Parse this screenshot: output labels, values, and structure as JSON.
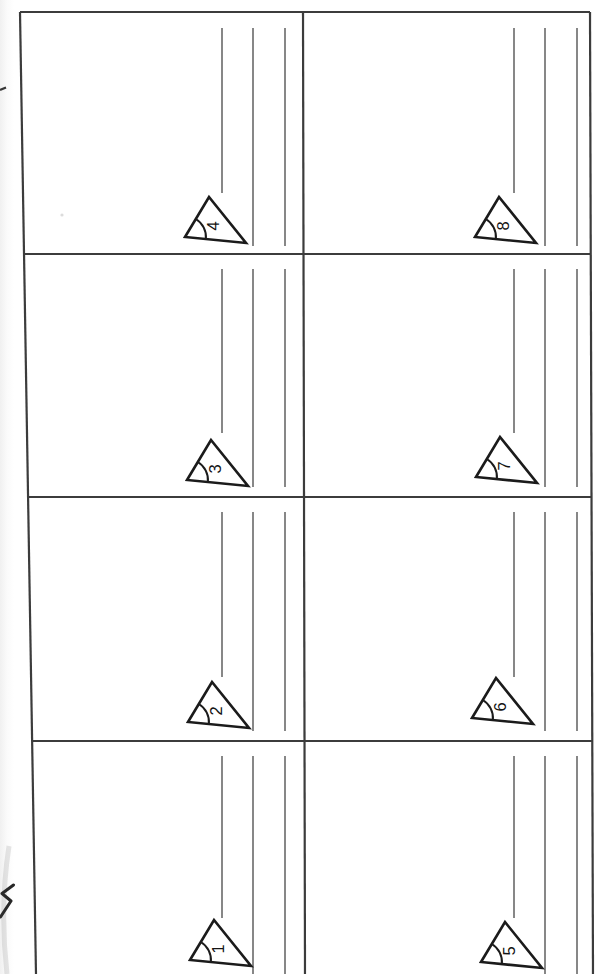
{
  "page": {
    "width": 598,
    "height": 974,
    "background": "#ffffff",
    "kind": "scanned worksheet page, rotated 90 degrees"
  },
  "colors": {
    "grid_line": "#3c3c3c",
    "answer_line": "#5f5f5f",
    "triangle_ink": "#1b1b1b",
    "number_ink": "#141414",
    "edge_shadow": "#dedede",
    "artifact_ink": "#262626"
  },
  "worksheet": {
    "grid": {
      "rows": 4,
      "cols": 2
    },
    "cells": [
      {
        "row": 0,
        "col": 0,
        "number": "4"
      },
      {
        "row": 0,
        "col": 1,
        "number": "8"
      },
      {
        "row": 1,
        "col": 0,
        "number": "3"
      },
      {
        "row": 1,
        "col": 1,
        "number": "7"
      },
      {
        "row": 2,
        "col": 0,
        "number": "2"
      },
      {
        "row": 2,
        "col": 1,
        "number": "6"
      },
      {
        "row": 3,
        "col": 0,
        "number": "1"
      },
      {
        "row": 3,
        "col": 1,
        "number": "5"
      }
    ],
    "cell_features": {
      "answer_lines_per_cell": 3,
      "triangle_mark": "small arc at lower-left vertex of each numbered triangle"
    }
  },
  "artifacts": {
    "edge_glyph": "cut-off ink mark at left page edge",
    "edge_tick": "tiny dash at upper left page edge",
    "paper_speck": "faint speck"
  }
}
